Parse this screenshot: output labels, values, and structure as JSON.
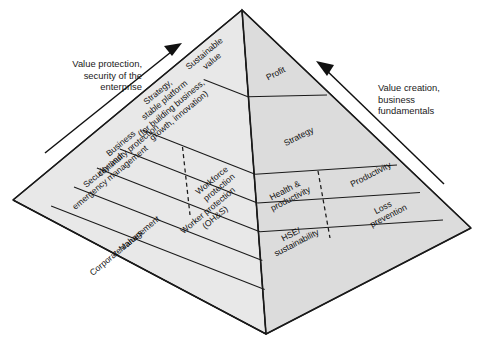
{
  "diagram": {
    "type": "3d-pyramid",
    "tier_count": 4,
    "colors": {
      "face_left": "#e8e8e8",
      "face_right": "#dcdcdc",
      "base": "#ececec",
      "outline": "#1a1a1a",
      "text": "#111111",
      "background": "#ffffff"
    }
  },
  "annotations": {
    "left": {
      "text": "Value protection,\nsecurity of the\nenterprise",
      "arrow": "up-right-arrow"
    },
    "right": {
      "text": "Value creation,\nbusiness\nfundamentals",
      "arrow": "up-left-arrow"
    }
  },
  "left_face": {
    "name": "value-protection-face",
    "tiers": [
      {
        "level": 1,
        "cells": [
          {
            "lines": [
              "Sustainable",
              "value"
            ]
          }
        ]
      },
      {
        "level": 2,
        "cells": [
          {
            "lines": [
              "Strategy,",
              "stable platform",
              "(for building business,",
              "growth, innovation)"
            ]
          }
        ]
      },
      {
        "level": 3,
        "cells": [
          {
            "lines": [
              "Business",
              "continuity protection"
            ]
          },
          {
            "lines": [
              "Workforce",
              "protection"
            ]
          }
        ]
      },
      {
        "level": 4,
        "cells": [
          {
            "lines": [
              "Security and",
              "emergency management"
            ]
          },
          {
            "lines": [
              "Worker protection",
              "(OH&S)"
            ]
          }
        ]
      },
      {
        "level": 5,
        "cells": [
          {
            "lines": [
              "Management"
            ]
          }
        ]
      },
      {
        "level": 6,
        "cells": [
          {
            "lines": [
              "Corporate values"
            ]
          }
        ]
      }
    ]
  },
  "right_face": {
    "name": "value-creation-face",
    "tiers": [
      {
        "level": 1,
        "cells": [
          {
            "lines": [
              "Profit"
            ]
          }
        ]
      },
      {
        "level": 2,
        "cells": [
          {
            "lines": [
              "Strategy"
            ]
          }
        ]
      },
      {
        "level": 3,
        "cells": [
          {
            "lines": [
              "Health &",
              "productivity"
            ]
          },
          {
            "lines": [
              "Productivity"
            ]
          }
        ]
      },
      {
        "level": 4,
        "cells": [
          {
            "lines": [
              "HSE/",
              "sustainability"
            ]
          },
          {
            "lines": [
              "Loss",
              "prevention"
            ]
          }
        ]
      }
    ]
  }
}
